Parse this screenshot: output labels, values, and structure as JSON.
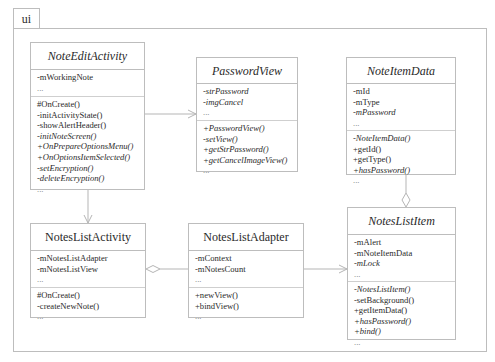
{
  "package": {
    "name": "ui"
  },
  "classes": {
    "note_edit_activity": {
      "name": "NoteEditActivity",
      "abstract_style": true,
      "attributes": [
        {
          "text": "-mWorkingNote",
          "italic": false
        },
        {
          "text": "...",
          "italic": false
        }
      ],
      "operations": [
        {
          "text": "#OnCreate()",
          "italic": false
        },
        {
          "text": "-initActivityState()",
          "italic": false
        },
        {
          "text": "-showAlertHeader()",
          "italic": false
        },
        {
          "text": "-initNoteScreen()",
          "italic": true
        },
        {
          "text": "+OnPrepareOptionsMenu()",
          "italic": true
        },
        {
          "text": "+OnOptionsItemSelected()",
          "italic": true
        },
        {
          "text": "-setEncryption()",
          "italic": true
        },
        {
          "text": "-deleteEncryption()",
          "italic": true
        },
        {
          "text": "...",
          "italic": false
        }
      ]
    },
    "password_view": {
      "name": "PasswordView",
      "abstract_style": true,
      "attributes": [
        {
          "text": "-strPassword",
          "italic": true
        },
        {
          "text": "-imgCancel",
          "italic": true
        },
        {
          "text": "...",
          "italic": false
        }
      ],
      "operations": [
        {
          "text": "+PasswordView()",
          "italic": true
        },
        {
          "text": "-setView()",
          "italic": true
        },
        {
          "text": "+getStrPassword()",
          "italic": true
        },
        {
          "text": "+getCancelImageView()",
          "italic": true
        },
        {
          "text": "...",
          "italic": false
        }
      ]
    },
    "note_item_data": {
      "name": "NoteItemData",
      "abstract_style": true,
      "attributes": [
        {
          "text": "-mId",
          "italic": false
        },
        {
          "text": "-mType",
          "italic": false
        },
        {
          "text": "-mPassword",
          "italic": true
        },
        {
          "text": "...",
          "italic": false
        }
      ],
      "operations": [
        {
          "text": "-NoteItemData()",
          "italic": true
        },
        {
          "text": "+getId()",
          "italic": false
        },
        {
          "text": "+getType()",
          "italic": false
        },
        {
          "text": "+hasPassword()",
          "italic": true
        },
        {
          "text": "...",
          "italic": false
        }
      ]
    },
    "notes_list_activity": {
      "name": "NotesListActivity",
      "abstract_style": false,
      "attributes": [
        {
          "text": "-mNotesListAdapter",
          "italic": false
        },
        {
          "text": "-mNotesListView",
          "italic": false
        },
        {
          "text": "...",
          "italic": false
        }
      ],
      "operations": [
        {
          "text": "#OnCreate()",
          "italic": false
        },
        {
          "text": "-createNewNote()",
          "italic": false
        },
        {
          "text": "...",
          "italic": false
        }
      ]
    },
    "notes_list_adapter": {
      "name": "NotesListAdapter",
      "abstract_style": false,
      "attributes": [
        {
          "text": "-mContext",
          "italic": false
        },
        {
          "text": "-mNotesCount",
          "italic": false
        },
        {
          "text": "...",
          "italic": false
        }
      ],
      "operations": [
        {
          "text": "+newView()",
          "italic": false
        },
        {
          "text": "+bindView()",
          "italic": false
        },
        {
          "text": "...",
          "italic": false
        }
      ]
    },
    "notes_list_item": {
      "name": "NotesListItem",
      "abstract_style": true,
      "attributes": [
        {
          "text": "-mAlert",
          "italic": false
        },
        {
          "text": "-mNoteItemData",
          "italic": false
        },
        {
          "text": "-mLock",
          "italic": true
        },
        {
          "text": "...",
          "italic": false
        }
      ],
      "operations": [
        {
          "text": "-NotesListItem()",
          "italic": true
        },
        {
          "text": "-setBackground()",
          "italic": false
        },
        {
          "text": "+getItemData()",
          "italic": false
        },
        {
          "text": "+hasPassword()",
          "italic": true
        },
        {
          "text": "+bind()",
          "italic": true
        },
        {
          "text": "...",
          "italic": false
        }
      ]
    }
  },
  "relationships": [
    {
      "from": "NoteEditActivity",
      "to": "PasswordView",
      "type": "dependency-arrow"
    },
    {
      "from": "NoteEditActivity",
      "to": "NotesListActivity",
      "type": "dependency-arrow"
    },
    {
      "from": "NotesListActivity",
      "to": "NotesListAdapter",
      "type": "aggregation"
    },
    {
      "from": "NotesListAdapter",
      "to": "NotesListItem",
      "type": "dependency-arrow"
    },
    {
      "from": "NotesListItem",
      "to": "NoteItemData",
      "type": "aggregation"
    }
  ],
  "colors": {
    "line": "#bdbdbd",
    "text": "#2a2a2a",
    "background": "#ffffff"
  }
}
